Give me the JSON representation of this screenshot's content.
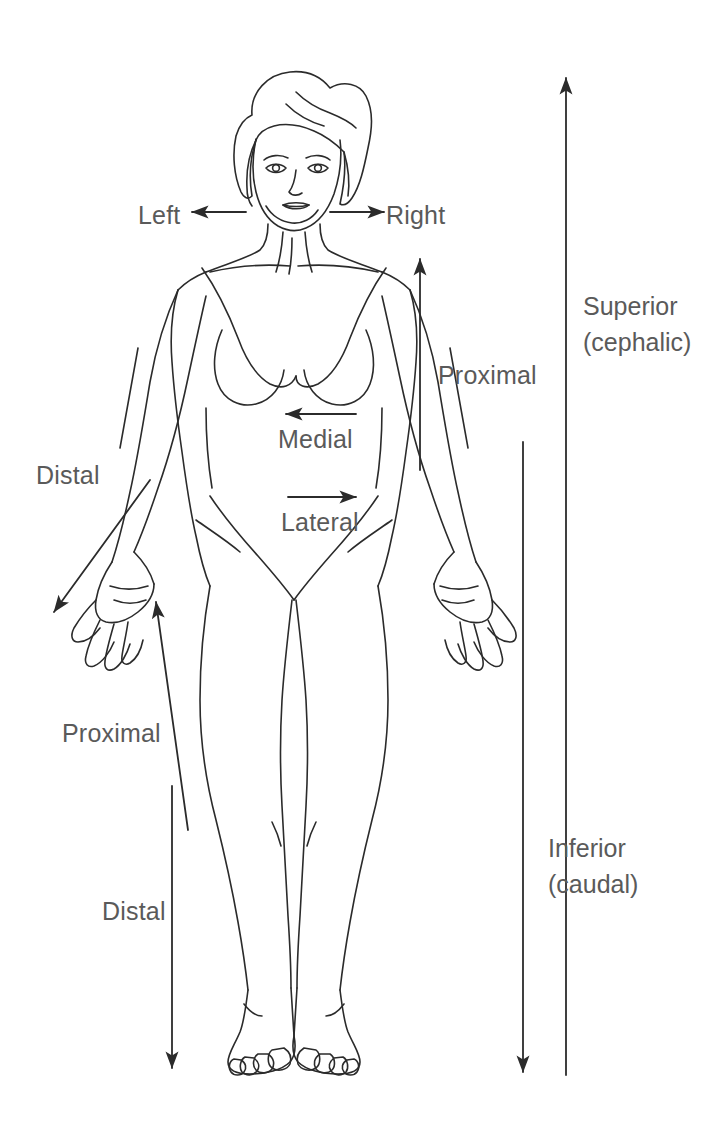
{
  "figure": {
    "background_color": "#ffffff",
    "line_color": "#2b2b2b",
    "text_color": "#5a5a5a"
  },
  "labels": {
    "left": "Left",
    "right": "Right",
    "medial": "Medial",
    "lateral": "Lateral",
    "distal_arm": "Distal",
    "proximal_arm": "Proximal",
    "proximal_leg": "Proximal",
    "distal_leg": "Distal",
    "superior_line1": "Superior",
    "superior_line2": "(cephalic)",
    "inferior_line1": "Inferior",
    "inferior_line2": "(caudal)"
  },
  "arrows": [
    {
      "name": "left-arrow",
      "direction": "left",
      "label": "Left"
    },
    {
      "name": "right-arrow",
      "direction": "right",
      "label": "Right"
    },
    {
      "name": "medial-arrow",
      "direction": "left",
      "label": "Medial"
    },
    {
      "name": "lateral-arrow",
      "direction": "right",
      "label": "Lateral"
    },
    {
      "name": "distal-arm-arrow",
      "direction": "down-left",
      "label": "Distal"
    },
    {
      "name": "proximal-arm-arrow",
      "direction": "up",
      "label": "Proximal"
    },
    {
      "name": "proximal-leg-arrow",
      "direction": "up",
      "label": "Proximal"
    },
    {
      "name": "distal-leg-arrow",
      "direction": "down",
      "label": "Distal"
    },
    {
      "name": "superior-arrow",
      "direction": "up",
      "label": "Superior (cephalic)"
    },
    {
      "name": "inferior-arrow",
      "direction": "down",
      "label": "Inferior (caudal)"
    }
  ]
}
